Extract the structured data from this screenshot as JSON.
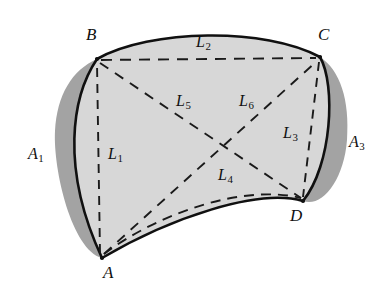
{
  "figure": {
    "colors": {
      "background": "#ffffff",
      "interior_fill": "#d7d7d7",
      "shadow_fill": "#a3a3a3",
      "outline_stroke": "#101010",
      "dashed_stroke": "#1a1a1a",
      "label_text": "#101010"
    }
  },
  "vertices": [
    {
      "id": "A",
      "label": "A",
      "x": 102,
      "y": 258,
      "label_x": 103,
      "label_y": 264
    },
    {
      "id": "B",
      "label": "B",
      "x": 97,
      "y": 59,
      "label_x": 86,
      "label_y": 26
    },
    {
      "id": "C",
      "label": "C",
      "x": 320,
      "y": 57,
      "label_x": 318,
      "label_y": 26
    },
    {
      "id": "D",
      "label": "D",
      "x": 303,
      "y": 201,
      "label_x": 290,
      "label_y": 207
    }
  ],
  "segments": [
    {
      "id": "L1",
      "label": "L",
      "sub": "1",
      "endpoints": "A-B",
      "style": "dashed",
      "label_x": 108,
      "label_y": 146
    },
    {
      "id": "L2",
      "label": "L",
      "sub": "2",
      "endpoints": "B-C",
      "style": "dashed",
      "label_x": 196,
      "label_y": 34
    },
    {
      "id": "L3",
      "label": "L",
      "sub": "3",
      "endpoints": "C-D",
      "style": "dashed",
      "label_x": 283,
      "label_y": 125
    },
    {
      "id": "L4",
      "label": "L",
      "sub": "4",
      "endpoints": "A-D",
      "style": "dashed-curved",
      "label_x": 218,
      "label_y": 167
    },
    {
      "id": "L5",
      "label": "L",
      "sub": "5",
      "endpoints": "A-C",
      "style": "dashed",
      "label_x": 176,
      "label_y": 93
    },
    {
      "id": "L6",
      "label": "L",
      "sub": "6",
      "endpoints": "B-D",
      "style": "dashed",
      "label_x": 239,
      "label_y": 93
    }
  ],
  "areas": [
    {
      "id": "A1",
      "label": "A",
      "sub": "1",
      "side": "left",
      "label_x": 28,
      "label_y": 146
    },
    {
      "id": "A3",
      "label": "A",
      "sub": "3",
      "side": "right",
      "label_x": 349,
      "label_y": 134
    }
  ]
}
